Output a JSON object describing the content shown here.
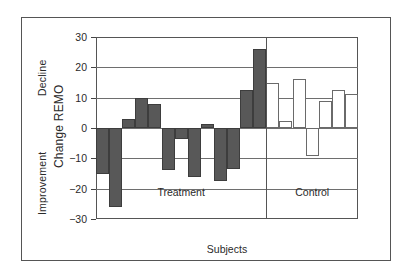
{
  "chart_data": {
    "type": "bar",
    "title": "",
    "xlabel": "Subjects",
    "ylabel": "Change REMO",
    "ylim": [
      -30,
      30
    ],
    "yticks": [
      30,
      20,
      10,
      0,
      -10,
      -20,
      -30
    ],
    "ytick_labels": [
      "30",
      "20",
      "10",
      "0",
      "−10",
      "−20",
      "−30"
    ],
    "grid": true,
    "legend": "none",
    "axis_direction_labels": {
      "top": "Decline",
      "bottom": "Improvement"
    },
    "groups": [
      {
        "name": "Treatment",
        "fill": "#585858",
        "values": [
          -15,
          -26,
          3,
          10,
          8,
          -14,
          -3.5,
          -16,
          1.3,
          -17.5,
          -13.5,
          12.5,
          26
        ]
      },
      {
        "name": "Control",
        "fill": "#ffffff",
        "values": [
          15,
          2.2,
          16.3,
          -9.3,
          8.8,
          12.5,
          11.2
        ]
      }
    ]
  },
  "figure": {
    "frame_color": "#555555",
    "grid_color": "#6e6e6e",
    "text_color": "#2a2a2a",
    "background": "#ffffff"
  }
}
